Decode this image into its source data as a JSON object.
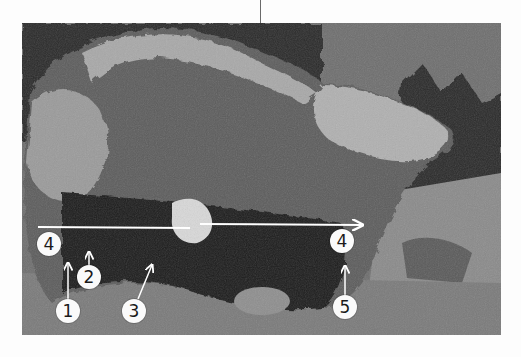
{
  "figure": {
    "markers": [
      {
        "label": "4",
        "x": 49,
        "y": 244
      },
      {
        "label": "2",
        "x": 89,
        "y": 277
      },
      {
        "label": "1",
        "x": 68,
        "y": 311
      },
      {
        "label": "3",
        "x": 134,
        "y": 311
      },
      {
        "label": "4",
        "x": 342,
        "y": 241
      },
      {
        "label": "5",
        "x": 345,
        "y": 307
      }
    ],
    "colors": {
      "marker_fill": "#fafafa",
      "marker_text": "#1a1a1a",
      "line": "#ffffff"
    }
  }
}
